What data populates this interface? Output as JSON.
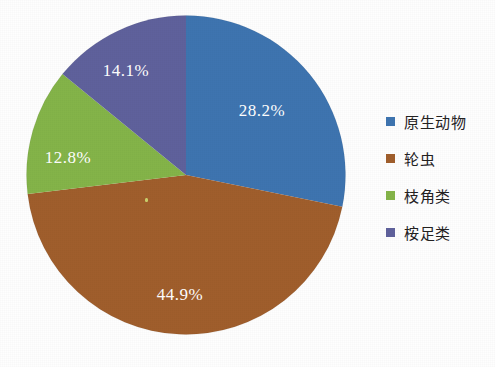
{
  "chart_data": {
    "type": "pie",
    "title": "",
    "subtitle": "",
    "xlabel": "",
    "ylabel": "",
    "grid": false,
    "legend_position": "right",
    "start_angle_deg": 0,
    "direction": "clockwise",
    "categories": [
      "原生动物",
      "轮虫",
      "枝角类",
      "桉足类"
    ],
    "values": [
      28.2,
      44.9,
      12.8,
      14.1
    ],
    "value_unit": "%",
    "data_labels": [
      "28.2%",
      "44.9%",
      "12.8%",
      "14.1%"
    ],
    "colors": [
      "#3E74B0",
      "#A05E2C",
      "#84B449",
      "#5F619C"
    ],
    "slices": [
      {
        "label": "原生动物",
        "value": 28.2,
        "data_label": "28.2%",
        "color": "#3E74B0",
        "start_deg": 0.0,
        "end_deg": 101.52,
        "label_x": 242,
        "label_y": 108
      },
      {
        "label": "轮虫",
        "value": 44.9,
        "data_label": "44.9%",
        "color": "#A05E2C",
        "start_deg": 101.52,
        "end_deg": 263.16,
        "label_x": 160,
        "label_y": 292
      },
      {
        "label": "枝角类",
        "value": 12.8,
        "data_label": "12.8%",
        "color": "#84B449",
        "start_deg": 263.16,
        "end_deg": 309.24,
        "label_x": 48,
        "label_y": 155
      },
      {
        "label": "桉足类",
        "value": 14.1,
        "data_label": "14.1%",
        "color": "#5F619C",
        "start_deg": 309.24,
        "end_deg": 360.0,
        "label_x": 106,
        "label_y": 68
      }
    ]
  },
  "legend": {
    "items": [
      {
        "label": "原生动物",
        "color": "#3E74B0"
      },
      {
        "label": "轮虫",
        "color": "#A05E2C"
      },
      {
        "label": "枝角类",
        "color": "#84B449"
      },
      {
        "label": "桉足类",
        "color": "#5F619C"
      }
    ]
  }
}
